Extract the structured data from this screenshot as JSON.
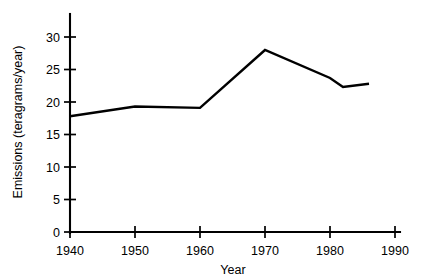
{
  "chart_data": {
    "type": "line",
    "title": "",
    "subtitle": "",
    "xlabel": "Year",
    "ylabel": "Emissions (teragrams/year)",
    "xlim": [
      1940,
      1990
    ],
    "ylim": [
      0,
      33
    ],
    "xticks": [
      1940,
      1950,
      1960,
      1970,
      1980,
      1990
    ],
    "yticks": [
      0,
      5,
      10,
      15,
      20,
      25,
      30
    ],
    "xtick_labels": [
      "1940",
      "1950",
      "1960",
      "1970",
      "1980",
      "1990"
    ],
    "ytick_labels": [
      "0",
      "5",
      "10",
      "15",
      "20",
      "25",
      "30"
    ],
    "grid": false,
    "legend": false,
    "legend_position": "none",
    "line_color": "#000000",
    "background_color": "#ffffff",
    "series": [
      {
        "name": "Emissions",
        "x": [
          1940,
          1950,
          1960,
          1970,
          1980,
          1982,
          1986
        ],
        "values": [
          17.8,
          19.3,
          19.1,
          28.0,
          23.7,
          22.3,
          22.8
        ]
      }
    ],
    "annotations": []
  },
  "axes": {
    "x_title": "Year",
    "y_title": "Emissions (teragrams/year)"
  },
  "colors": {
    "line": "#000000",
    "axis": "#000000",
    "background": "#ffffff"
  }
}
